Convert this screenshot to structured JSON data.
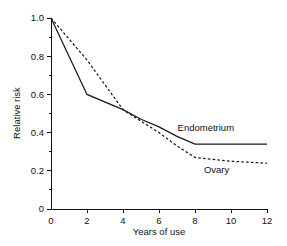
{
  "chart_data": {
    "type": "line",
    "title": "",
    "xlabel": "Years of use",
    "ylabel": "Relative risk",
    "xlim": [
      0,
      12
    ],
    "ylim": [
      0,
      1.0
    ],
    "xticks": [
      "0",
      "2",
      "4",
      "6",
      "8",
      "10",
      "12"
    ],
    "yticks": [
      "0",
      "0.2",
      "0.4",
      "0.6",
      "0.8",
      "1.0"
    ],
    "xtick_values": [
      0,
      2,
      4,
      6,
      8,
      10,
      12
    ],
    "ytick_values": [
      0,
      0.2,
      0.4,
      0.6,
      0.8,
      1.0
    ],
    "y_minor_step": 0.1,
    "grid": false,
    "legend_position": "inline-right-annotation",
    "series": [
      {
        "name": "Endometrium",
        "style": "solid",
        "color": "#1a1a1a",
        "label_text": "Endometrium",
        "x": [
          0,
          2,
          4,
          5,
          6,
          7,
          8,
          10,
          12
        ],
        "values": [
          1.0,
          0.6,
          0.52,
          0.47,
          0.43,
          0.38,
          0.34,
          0.34,
          0.34
        ]
      },
      {
        "name": "Ovary",
        "style": "dashed",
        "color": "#1a1a1a",
        "label_text": "Ovary",
        "x": [
          0,
          2,
          4,
          5,
          6,
          7,
          8,
          10,
          12
        ],
        "values": [
          1.0,
          0.78,
          0.52,
          0.46,
          0.4,
          0.33,
          0.27,
          0.25,
          0.24
        ]
      }
    ],
    "annotations": [
      {
        "text": "Endometrium",
        "x": 8.6,
        "y": 0.41
      },
      {
        "text": "Ovary",
        "x": 9.2,
        "y": 0.19
      }
    ]
  }
}
